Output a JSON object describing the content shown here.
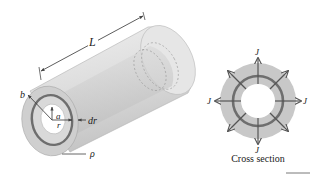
{
  "figure": {
    "left_diagram": {
      "description": "Hollow cylindrical conductor with inner radius a, outer radius b, length L",
      "labels": {
        "length": "L",
        "outer_radius": "b",
        "inner_radius": "a",
        "radius": "r",
        "shell_thickness": "dr",
        "resistivity": "ρ"
      }
    },
    "right_diagram": {
      "current_density_labels": {
        "top": "J",
        "left": "J",
        "right": "J",
        "bottom": "J"
      },
      "caption": "Cross section"
    },
    "colors": {
      "material_fill": "#c8c8c8",
      "body_light": "#e4e4e4",
      "shell_ring": "#6e6e6e",
      "arrows": "#555555",
      "text": "#222222"
    }
  }
}
